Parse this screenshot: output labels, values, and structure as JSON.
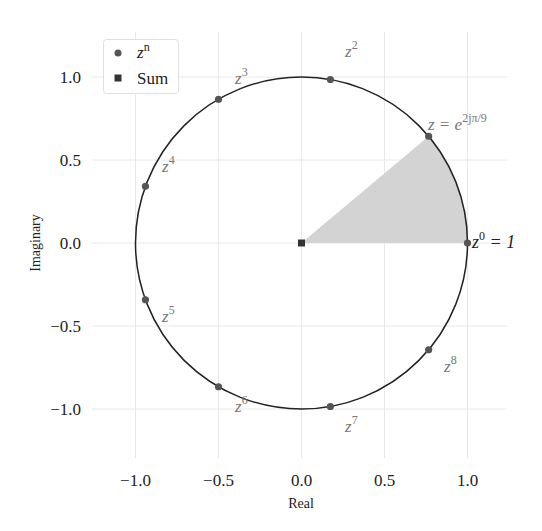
{
  "chart_data": {
    "type": "scatter",
    "title": "",
    "xlabel": "Real",
    "ylabel": "Imaginary",
    "xlim": [
      -1.25,
      1.25
    ],
    "ylim": [
      -1.28,
      1.28
    ],
    "xticks": [
      -1.0,
      -0.5,
      0.0,
      0.5,
      1.0
    ],
    "yticks": [
      -1.0,
      -0.5,
      0.0,
      0.5,
      1.0
    ],
    "xtick_labels": [
      "−1.0",
      "−0.5",
      "0.0",
      "0.5",
      "1.0"
    ],
    "ytick_labels": [
      "−1.0",
      "−0.5",
      "0.0",
      "0.5",
      "1.0"
    ],
    "grid": true,
    "legend_position": "upper left",
    "unit_circle": {
      "center": [
        0,
        0
      ],
      "radius": 1
    },
    "shaded_wedge": {
      "from_angle_deg": 0,
      "to_angle_deg": 40,
      "color": "#d3d3d3"
    },
    "series": [
      {
        "name": "z^n",
        "marker": "circle",
        "color": "#555555",
        "points": [
          {
            "n": 0,
            "x": 1.0,
            "y": 0.0,
            "label": "z⁰ = 1"
          },
          {
            "n": 1,
            "x": 0.766,
            "y": 0.643,
            "label": "z = e^{2jπ/9}"
          },
          {
            "n": 2,
            "x": 0.174,
            "y": 0.985,
            "label": "z²"
          },
          {
            "n": 3,
            "x": -0.5,
            "y": 0.866,
            "label": "z³"
          },
          {
            "n": 4,
            "x": -0.94,
            "y": 0.342,
            "label": "z⁴"
          },
          {
            "n": 5,
            "x": -0.94,
            "y": -0.342,
            "label": "z⁵"
          },
          {
            "n": 6,
            "x": -0.5,
            "y": -0.866,
            "label": "z⁶"
          },
          {
            "n": 7,
            "x": 0.174,
            "y": -0.985,
            "label": "z⁷"
          },
          {
            "n": 8,
            "x": 0.766,
            "y": -0.643,
            "label": "z⁸"
          }
        ]
      },
      {
        "name": "Sum",
        "marker": "square",
        "color": "#333333",
        "points": [
          {
            "x": 0.0,
            "y": 0.0
          }
        ]
      }
    ]
  },
  "legend": {
    "items": [
      {
        "label_base": "z",
        "label_sup": "n"
      },
      {
        "label": "Sum"
      }
    ]
  },
  "axes": {
    "xlabel": "Real",
    "ylabel": "Imaginary"
  },
  "annotations": {
    "z0": {
      "base": "z",
      "sup": "0",
      "rest": " = 1"
    },
    "z1": {
      "base": "z = e",
      "sup": "2jπ/9"
    },
    "z2": {
      "base": "z",
      "sup": "2"
    },
    "z3": {
      "base": "z",
      "sup": "3"
    },
    "z4": {
      "base": "z",
      "sup": "4"
    },
    "z5": {
      "base": "z",
      "sup": "5"
    },
    "z6": {
      "base": "z",
      "sup": "6"
    },
    "z7": {
      "base": "z",
      "sup": "7"
    },
    "z8": {
      "base": "z",
      "sup": "8"
    }
  },
  "colors": {
    "grid": "#e6e6e6",
    "circle": "#222222",
    "point": "#555555",
    "sum": "#333333",
    "wedge": "#d4d4d4"
  }
}
